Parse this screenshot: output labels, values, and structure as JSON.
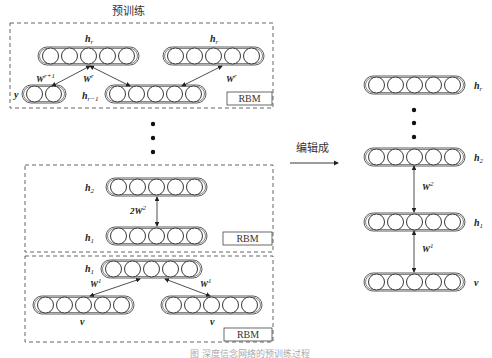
{
  "title": "预训练",
  "edit_label": "编辑成",
  "rbm_label": "RBM",
  "caption": "图 深度信念网络的预训练过程",
  "pretrain": {
    "top_block": {
      "layers": [
        {
          "name": "h",
          "sub": "r"
        },
        {
          "name": "h",
          "sub": "r"
        },
        {
          "name": "y",
          "sub": ""
        },
        {
          "name": "h",
          "sub": "r−1"
        }
      ],
      "weights": [
        {
          "name": "W",
          "sup": "r+1"
        },
        {
          "name": "W",
          "sup": "r"
        },
        {
          "name": "W",
          "sup": "r"
        }
      ]
    },
    "middle_block": {
      "layers": [
        {
          "name": "h",
          "sub": "2"
        },
        {
          "name": "h",
          "sub": "1"
        }
      ],
      "weights": [
        {
          "name": "2W",
          "sup": "2"
        }
      ]
    },
    "bottom_block": {
      "layers": [
        {
          "name": "h",
          "sub": "1"
        },
        {
          "name": "v",
          "sub": ""
        },
        {
          "name": "v",
          "sub": ""
        }
      ],
      "weights": [
        {
          "name": "W",
          "sup": "1"
        },
        {
          "name": "W",
          "sup": "1"
        }
      ]
    }
  },
  "unrolled": {
    "layers": [
      {
        "name": "h",
        "sub": "r"
      },
      {
        "name": "h",
        "sub": "2"
      },
      {
        "name": "h",
        "sub": "1"
      },
      {
        "name": "v",
        "sub": ""
      }
    ],
    "weights": [
      {
        "name": "W",
        "sup": "2"
      },
      {
        "name": "W",
        "sup": "1"
      }
    ]
  },
  "units_per_layer": 5,
  "units_label_layer": 2
}
